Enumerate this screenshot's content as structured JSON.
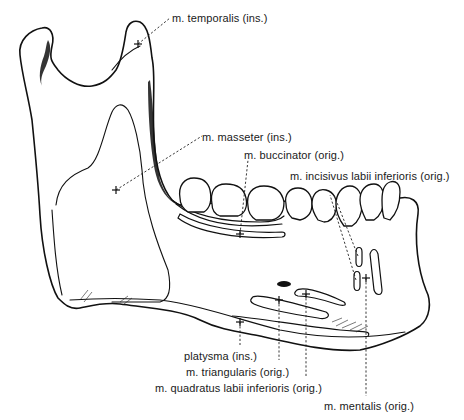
{
  "figure": {
    "labels": [
      {
        "id": "temporalis",
        "text": "m. temporalis (ins.)"
      },
      {
        "id": "masseter",
        "text": "m. masseter (ins.)"
      },
      {
        "id": "buccinator",
        "text": "m. buccinator (orig.)"
      },
      {
        "id": "incisivus",
        "text": "m. incisivus labii inferioris (orig.)"
      },
      {
        "id": "platysma",
        "text": "platysma (ins.)"
      },
      {
        "id": "triangularis",
        "text": "m. triangularis (orig.)"
      },
      {
        "id": "quadratus",
        "text": "m. quadratus labii inferioris (orig.)"
      },
      {
        "id": "mentalis",
        "text": "m. mentalis (orig.)"
      }
    ]
  },
  "colors": {
    "line": "#111111",
    "background": "#ffffff",
    "text": "#1a1a1a"
  }
}
